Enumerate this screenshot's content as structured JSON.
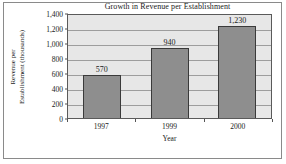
{
  "chart_data": {
    "type": "bar",
    "title": "Growth in Revenue per Establishment",
    "xlabel": "Year",
    "ylabel_line1": "Revenue per",
    "ylabel_line2": "Establishment (thousands)",
    "categories": [
      "1997",
      "1999",
      "2000"
    ],
    "values": [
      570,
      940,
      1230
    ],
    "value_labels": [
      "570",
      "940",
      "1,230"
    ],
    "ylim": [
      0,
      1400
    ],
    "yticks": [
      0,
      200,
      400,
      600,
      800,
      1000,
      1200,
      1400
    ],
    "ytick_labels": [
      "0",
      "200",
      "400",
      "600",
      "800",
      "1,000",
      "1,200",
      "1,400"
    ],
    "grid": true,
    "legend": false,
    "colors": {
      "bar_fill": "#8e8e8e",
      "bar_border": "#3a3a3a",
      "plot_background": "#e7e7e7",
      "gridline": "#9d9d9d",
      "axis": "#5a5a5a",
      "frame": "#8a8a8a",
      "text": "#1a1a1a"
    }
  }
}
